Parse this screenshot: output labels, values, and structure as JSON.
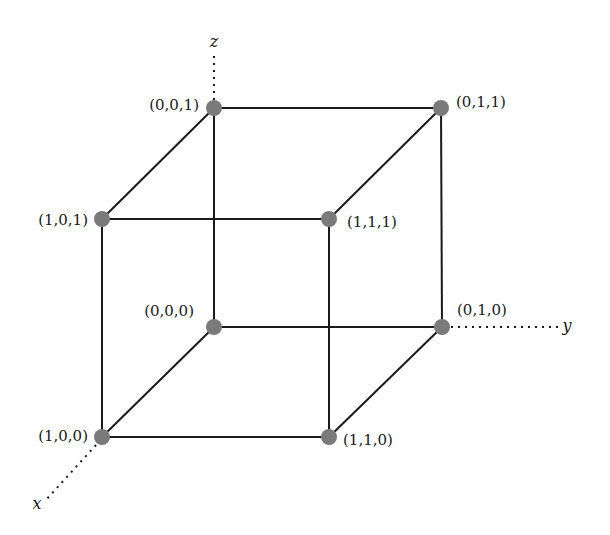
{
  "diagram": {
    "type": "unit-cube-vertices",
    "axes": {
      "x": {
        "label": "x"
      },
      "y": {
        "label": "y"
      },
      "z": {
        "label": "z"
      }
    },
    "vertices": {
      "v001": {
        "label": "(0,0,1)"
      },
      "v011": {
        "label": "(0,1,1)"
      },
      "v101": {
        "label": "(1,0,1)"
      },
      "v111": {
        "label": "(1,1,1)"
      },
      "v000": {
        "label": "(0,0,0)"
      },
      "v010": {
        "label": "(0,1,0)"
      },
      "v100": {
        "label": "(1,0,0)"
      },
      "v110": {
        "label": "(1,1,0)"
      }
    },
    "edges": [
      [
        "(0,0,1)",
        "(0,1,1)"
      ],
      [
        "(0,0,1)",
        "(1,0,1)"
      ],
      [
        "(0,0,1)",
        "(0,0,0)"
      ],
      [
        "(0,1,1)",
        "(1,1,1)"
      ],
      [
        "(0,1,1)",
        "(0,1,0)"
      ],
      [
        "(1,0,1)",
        "(1,1,1)"
      ],
      [
        "(1,0,1)",
        "(1,0,0)"
      ],
      [
        "(1,1,1)",
        "(1,1,0)"
      ],
      [
        "(0,0,0)",
        "(0,1,0)"
      ],
      [
        "(0,0,0)",
        "(1,0,0)"
      ],
      [
        "(0,1,0)",
        "(1,1,0)"
      ],
      [
        "(1,0,0)",
        "(1,1,0)"
      ]
    ],
    "colors": {
      "edge": "#1a1a1a",
      "vertex": "#7a7a7a",
      "background": "#ffffff"
    }
  }
}
